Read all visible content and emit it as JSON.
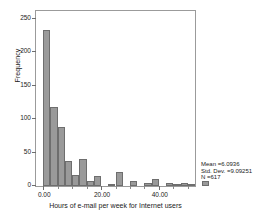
{
  "chart_data": {
    "type": "bar",
    "title": "",
    "xlabel": "Hours of e-mail per week for Internet users",
    "ylabel": "Frequency",
    "xlim": [
      -2.5,
      52.5
    ],
    "ylim": [
      0,
      262
    ],
    "grid": false,
    "legend": null,
    "bin_width": 2.5,
    "xticks": [
      "0.00",
      "20.00",
      "40.00"
    ],
    "xtick_values": [
      0,
      20,
      40
    ],
    "yticks": [
      "0",
      "50",
      "100",
      "150",
      "200",
      "250"
    ],
    "ytick_values": [
      0,
      50,
      100,
      150,
      200,
      250
    ],
    "bins": [
      {
        "x": 0.0,
        "value": 234
      },
      {
        "x": 2.5,
        "value": 118
      },
      {
        "x": 5.0,
        "value": 89
      },
      {
        "x": 7.5,
        "value": 37
      },
      {
        "x": 10.0,
        "value": 16
      },
      {
        "x": 12.5,
        "value": 41
      },
      {
        "x": 15.0,
        "value": 7
      },
      {
        "x": 17.5,
        "value": 15
      },
      {
        "x": 20.0,
        "value": 0
      },
      {
        "x": 22.5,
        "value": 1
      },
      {
        "x": 25.0,
        "value": 21
      },
      {
        "x": 27.5,
        "value": 0
      },
      {
        "x": 30.0,
        "value": 8
      },
      {
        "x": 32.5,
        "value": 0
      },
      {
        "x": 35.0,
        "value": 4
      },
      {
        "x": 37.5,
        "value": 10
      },
      {
        "x": 40.0,
        "value": 0
      },
      {
        "x": 42.5,
        "value": 4
      },
      {
        "x": 45.0,
        "value": 1
      },
      {
        "x": 47.5,
        "value": 5
      },
      {
        "x": 50.0,
        "value": 1
      },
      {
        "x": 52.5,
        "value": 0
      },
      {
        "x": 55.0,
        "value": 8
      }
    ]
  },
  "stats": {
    "mean": "Mean =6.0936",
    "std_dev": "Std. Dev. =9.09251",
    "n": "N =617"
  }
}
